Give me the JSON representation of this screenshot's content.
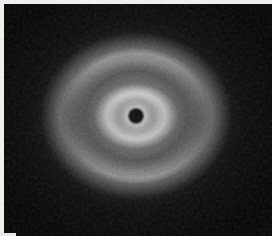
{
  "figure": {
    "kind": "diffraction-pattern",
    "width_px": 272,
    "height_px": 236,
    "background_color": "#0a0a0a",
    "plate_color": "#111111",
    "margin_color": "#efefed",
    "highlight_color": "#ffffff"
  },
  "chart_data": {
    "type": "heatmap",
    "subtitle": "",
    "xlabel": "",
    "ylabel": "",
    "grid": false,
    "legend": "none",
    "colormap": "grayscale",
    "intensity_range": [
      0,
      255
    ],
    "center": {
      "x": 132,
      "y": 112
    },
    "beam_stop": {
      "x": 132,
      "y": 112,
      "radius_px": 7,
      "intensity": 10
    },
    "symmetry": "vertical-axis textured (fiber) arcs",
    "radial_profile": {
      "r_px": [
        0,
        7,
        14,
        22,
        30,
        40,
        52,
        62,
        72,
        84,
        96,
        110,
        126,
        140
      ],
      "intensity": [
        10,
        12,
        200,
        235,
        150,
        120,
        175,
        150,
        118,
        135,
        112,
        70,
        36,
        16
      ]
    },
    "rings": [
      {
        "name": "central-beam-halo",
        "mean_radius_px": 18,
        "width_px": 14,
        "peak_intensity": 238,
        "azimuthal_texture": "isotropic"
      },
      {
        "name": "first-amorphous-halo",
        "mean_radius_px": 30,
        "width_px": 16,
        "peak_intensity": 196,
        "azimuthal_texture": "vertical-arcs",
        "arc_centers_deg": [
          90,
          270
        ]
      },
      {
        "name": "second-amorphous-halo",
        "mean_radius_px": 66,
        "width_px": 24,
        "peak_intensity": 156,
        "azimuthal_texture": "vertical-arcs",
        "arc_centers_deg": [
          90,
          270
        ]
      },
      {
        "name": "outer-diffuse-halo",
        "mean_radius_px": 108,
        "width_px": 36,
        "peak_intensity": 86,
        "azimuthal_texture": "weak"
      }
    ],
    "features": [
      {
        "label": "beam-stop",
        "x": 132,
        "y": 112,
        "intensity": 10
      },
      {
        "label": "upper-inner-arc",
        "x": 132,
        "y": 82,
        "intensity": 196
      },
      {
        "label": "lower-inner-arc",
        "x": 132,
        "y": 141,
        "intensity": 188
      },
      {
        "label": "upper-outer-arc",
        "x": 132,
        "y": 58,
        "intensity": 150
      },
      {
        "label": "lower-outer-arc",
        "x": 132,
        "y": 176,
        "intensity": 146
      },
      {
        "label": "corner-background",
        "x": 248,
        "y": 20,
        "intensity": 11
      }
    ],
    "noise": {
      "type": "film-grain",
      "amplitude": 0.18
    }
  }
}
